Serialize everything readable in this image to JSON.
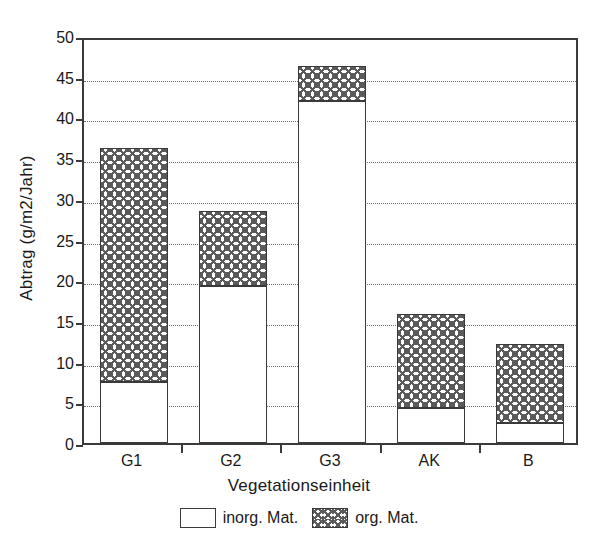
{
  "chart_data": {
    "type": "bar",
    "stacked": true,
    "title": "",
    "xlabel": "Vegetationseinheit",
    "ylabel": "Abtrag (g/m2/Jahr)",
    "categories": [
      "G1",
      "G2",
      "G3",
      "AK",
      "B"
    ],
    "series": [
      {
        "name": "inorg. Mat.",
        "values": [
          7.5,
          19.3,
          42.0,
          4.3,
          2.5
        ]
      },
      {
        "name": "org. Mat.",
        "values": [
          28.7,
          9.2,
          4.3,
          11.5,
          9.7
        ]
      }
    ],
    "totals": [
      36.2,
      28.5,
      46.3,
      15.8,
      12.2
    ],
    "ylim": [
      0,
      50
    ],
    "yticks": [
      0,
      5,
      10,
      15,
      20,
      25,
      30,
      35,
      40,
      45,
      50
    ],
    "ytick_labels": [
      "0",
      "5",
      "10",
      "15",
      "20",
      "25",
      "30",
      "35",
      "40",
      "45",
      "50"
    ],
    "grid": "horizontal-dotted",
    "legend_position": "bottom-center",
    "legend": [
      "inorg. Mat.",
      "org. Mat."
    ],
    "colors": {
      "axis": "#3a3a3a",
      "grid": "#6b6b6b",
      "inorg_fill": "#ffffff",
      "org_hatch": "#5a5a5a",
      "background": "#ffffff"
    }
  }
}
